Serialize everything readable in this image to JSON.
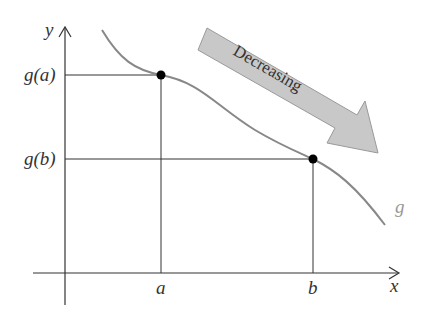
{
  "axes": {
    "x_label": "x",
    "y_label": "y"
  },
  "points": {
    "a": {
      "x_label": "a",
      "y_label": "g(a)"
    },
    "b": {
      "x_label": "b",
      "y_label": "g(b)"
    }
  },
  "function_label": "g",
  "arrow_label": "Decreasing",
  "colors": {
    "curve": "#888888",
    "arrow_fill": "#c8c8c8",
    "arrow_stroke": "#9a9a9a",
    "axis": "#333333"
  }
}
